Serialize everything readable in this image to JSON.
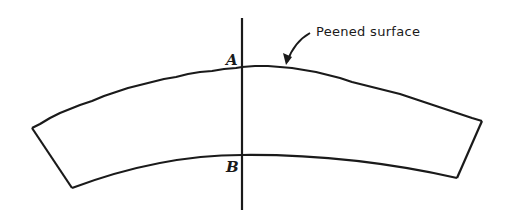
{
  "diagram": {
    "title": "",
    "labels": {
      "point_a": "A",
      "point_b": "B",
      "annotation": "Peened surface"
    },
    "colors": {
      "stroke": "#1a1a1a",
      "background": "#ffffff"
    }
  }
}
